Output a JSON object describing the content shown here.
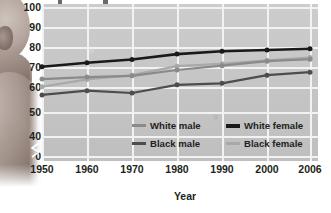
{
  "chart_data": {
    "type": "line",
    "title": "",
    "xlabel": "Year",
    "ylabel": "",
    "x": [
      1950,
      1960,
      1970,
      1980,
      1990,
      2000,
      2006
    ],
    "xtick_labels": [
      "1950",
      "1960",
      "1970",
      "1980",
      "1990",
      "2000",
      "2006"
    ],
    "ytick_labels": [
      "100",
      "90",
      "80",
      "70",
      "60",
      "50",
      "40",
      "0"
    ],
    "ylim": [
      40,
      100
    ],
    "y_axis_break": true,
    "y_axis_break_between": [
      0,
      40
    ],
    "grid": true,
    "legend_position": "inside-lower-right",
    "plot_background": "#c9c9c9",
    "gridline_color": "#f2f2f2",
    "series": [
      {
        "name": "White male",
        "color": "#8a8a8a",
        "values": [
          66.5,
          67.4,
          68.0,
          70.7,
          72.7,
          74.8,
          75.7
        ]
      },
      {
        "name": "White female",
        "color": "#1a1a1a",
        "values": [
          72.2,
          74.1,
          75.6,
          78.1,
          79.4,
          80.0,
          80.6
        ]
      },
      {
        "name": "Black male",
        "color": "#4d4d4d",
        "values": [
          59.1,
          61.1,
          60.0,
          63.8,
          64.5,
          68.3,
          69.7
        ]
      },
      {
        "name": "Black female",
        "color": "#a8a8a8",
        "values": [
          62.9,
          66.3,
          68.3,
          72.5,
          73.6,
          75.2,
          76.5
        ]
      }
    ]
  },
  "axis": {
    "x_title": "Year"
  },
  "legend": {
    "items": [
      {
        "label": "White male",
        "color": "#8a8a8a"
      },
      {
        "label": "White female",
        "color": "#1a1a1a"
      },
      {
        "label": "Black male",
        "color": "#4d4d4d"
      },
      {
        "label": "Black female",
        "color": "#a8a8a8"
      }
    ]
  },
  "photo": {
    "subject": "infant-photograph"
  }
}
